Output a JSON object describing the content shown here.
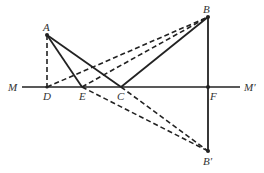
{
  "diagram": {
    "type": "geometry-reflection",
    "points": {
      "A": {
        "label": "A",
        "x": 47,
        "y": 35
      },
      "B": {
        "label": "B",
        "x": 208,
        "y": 17
      },
      "C": {
        "label": "C",
        "x": 121,
        "y": 87
      },
      "D": {
        "label": "D",
        "x": 47,
        "y": 87
      },
      "E": {
        "label": "E",
        "x": 82,
        "y": 87
      },
      "F": {
        "label": "F",
        "x": 208,
        "y": 87
      },
      "B_prime": {
        "label": "B′",
        "x": 208,
        "y": 151
      }
    },
    "line_labels": {
      "M": "M",
      "M_prime": "M′"
    },
    "colors": {
      "stroke": "#222222",
      "text": "#333333"
    }
  }
}
